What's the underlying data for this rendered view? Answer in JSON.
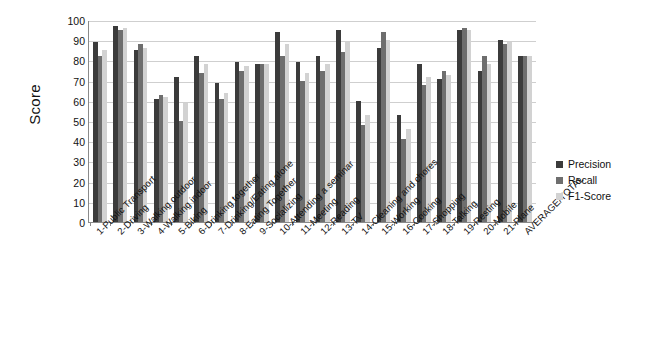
{
  "chart_data": {
    "type": "bar",
    "title": "",
    "xlabel": "",
    "ylabel": "Score",
    "ylim": [
      0,
      100
    ],
    "ytick_step": 10,
    "yticks": [
      0,
      10,
      20,
      30,
      40,
      50,
      60,
      70,
      80,
      90,
      100
    ],
    "grid": true,
    "legend_position": "right",
    "colors": {
      "precision": "#3b3b3b",
      "recall": "#6e6e6e",
      "f1": "#d2d2d2",
      "grid": "#cfcfcf",
      "axis": "#8a8a8a",
      "text": "#111111",
      "background": "#ffffff"
    },
    "categories": [
      "1-Public Transport",
      "2-Driving",
      "3-Walking outdoor",
      "4-Walking indoor",
      "5-Biking",
      "6-Drinking together",
      "7-Drinking/Eating alone",
      "8-Eating Together",
      "9-Socializing",
      "10-Attending a seminar",
      "11-Meeting",
      "12-Reading",
      "13-TV",
      "14-Cleaning and chores",
      "15-Working",
      "16-Cooking",
      "17-Shopping",
      "18-Talking",
      "19-Resting",
      "20-Mobile",
      "21-Plane",
      "AVERAGE/TOTAL"
    ],
    "series": [
      {
        "name": "Precision",
        "values": [
          89,
          97,
          85,
          61,
          72,
          82,
          69,
          79,
          78,
          94,
          79,
          82,
          95,
          60,
          86,
          53,
          78,
          71,
          95,
          75,
          90,
          82
        ]
      },
      {
        "name": "Recall",
        "values": [
          82,
          95,
          88,
          63,
          50,
          74,
          61,
          75,
          78,
          82,
          70,
          75,
          84,
          48,
          94,
          41,
          68,
          75,
          96,
          82,
          88,
          82
        ]
      },
      {
        "name": "F1-Score",
        "values": [
          85,
          96,
          86,
          62,
          59,
          78,
          64,
          77,
          78,
          88,
          74,
          78,
          89,
          53,
          90,
          46,
          72,
          73,
          95,
          78,
          89,
          82
        ]
      }
    ]
  },
  "legend": {
    "items": [
      {
        "label": "Precision"
      },
      {
        "label": "Recall"
      },
      {
        "label": "F1-Score"
      }
    ]
  }
}
